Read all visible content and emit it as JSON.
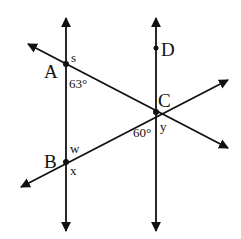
{
  "figure": {
    "type": "geometry-diagram",
    "colors": {
      "ink": "#111111",
      "background": "#ffffff"
    }
  },
  "points": {
    "A": {
      "label": "A",
      "x": 66,
      "y": 64
    },
    "B": {
      "label": "B",
      "x": 66,
      "y": 162
    },
    "C": {
      "label": "C",
      "x": 156,
      "y": 112
    },
    "D": {
      "label": "D",
      "x": 156,
      "y": 48
    }
  },
  "angles": {
    "s": "s",
    "a63": "63°",
    "w": "w",
    "x": "x",
    "a60": "60°",
    "y": "y"
  },
  "lines": [
    {
      "name": "left-vertical",
      "through": [
        "A",
        "B"
      ],
      "arrows": "both"
    },
    {
      "name": "right-vertical",
      "through": [
        "D",
        "C"
      ],
      "arrows": "both"
    },
    {
      "name": "transversal-AC",
      "through": [
        "A",
        "C"
      ],
      "arrows": "both"
    },
    {
      "name": "transversal-BC",
      "through": [
        "B",
        "C"
      ],
      "arrows": "both"
    }
  ]
}
